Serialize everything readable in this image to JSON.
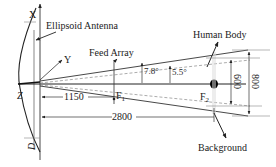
{
  "diagram": {
    "axes": {
      "x_label": "X",
      "y_label": "Y",
      "z_label": "Z",
      "d_label": "D"
    },
    "labels": {
      "ellipsoid_antenna": "Ellipsoid Antenna",
      "feed_array": "Feed Array",
      "human_body": "Human Body",
      "background": "Background",
      "focus1": "F",
      "focus1_sub": "1",
      "focus2": "F",
      "focus2_sub": "2"
    },
    "angles": {
      "outer": "7.8°",
      "inner": "5.5°"
    },
    "dimensions": {
      "feed_distance": "1150",
      "target_distance": "2800",
      "inner_height": "600",
      "outer_height": "800"
    },
    "colors": {
      "line": "#333333",
      "dashed": "#888888",
      "target_dot": "#000000"
    }
  }
}
